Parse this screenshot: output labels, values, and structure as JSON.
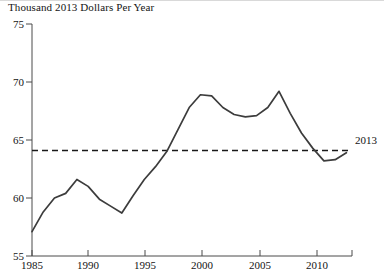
{
  "chart_data": {
    "type": "line",
    "title": "Thousand 2013 Dollars Per Year",
    "xlabel": "",
    "ylabel": "Thousand 2013 Dollars Per Year",
    "xlim": [
      1985,
      2013.5
    ],
    "ylim": [
      55,
      75
    ],
    "xticks": [
      1985,
      1990,
      1995,
      2000,
      2005,
      2010
    ],
    "yticks": [
      55,
      60,
      65,
      70,
      75
    ],
    "grid": false,
    "legend": "none",
    "x": [
      1985,
      1986,
      1987,
      1988,
      1989,
      1990,
      1991,
      1992,
      1993,
      1994,
      1995,
      1996,
      1997,
      1998,
      1999,
      2000,
      2001,
      2002,
      2003,
      2004,
      2005,
      2006,
      2007,
      2008,
      2009,
      2010,
      2011,
      2012,
      2013
    ],
    "series": [
      {
        "name": "Real income per year",
        "style": "solid",
        "color": "#3c3c3c",
        "values": [
          57.1,
          58.8,
          60.0,
          60.4,
          61.6,
          61.0,
          59.9,
          59.3,
          58.7,
          60.2,
          61.6,
          62.7,
          64.0,
          65.9,
          67.8,
          68.9,
          68.8,
          67.8,
          67.2,
          67.0,
          67.1,
          67.8,
          69.2,
          67.3,
          65.6,
          64.3,
          63.2,
          63.3,
          63.9
        ]
      }
    ],
    "reference_line": {
      "name": "2013 level",
      "style": "dashed",
      "color": "#1a1a1a",
      "value": 64.1,
      "x_start": 1985,
      "x_end": 2013.5,
      "annotation": "2013"
    },
    "annotations": [
      {
        "text": "2013",
        "x": 2013.5,
        "y": 65.6
      }
    ]
  },
  "ytick_labels": [
    "75",
    "70",
    "65",
    "60",
    "55"
  ],
  "xtick_labels": [
    "1985",
    "1990",
    "1995",
    "2000",
    "2005",
    "2010"
  ],
  "axis": {
    "title": "Thousand 2013 Dollars Per Year"
  },
  "annotation": {
    "label_2013": "2013"
  },
  "colors": {
    "line": "#3c3c3c",
    "reference": "#1a1a1a",
    "axis": "#4a4a4a",
    "text": "#141414",
    "background": "#ffffff"
  }
}
